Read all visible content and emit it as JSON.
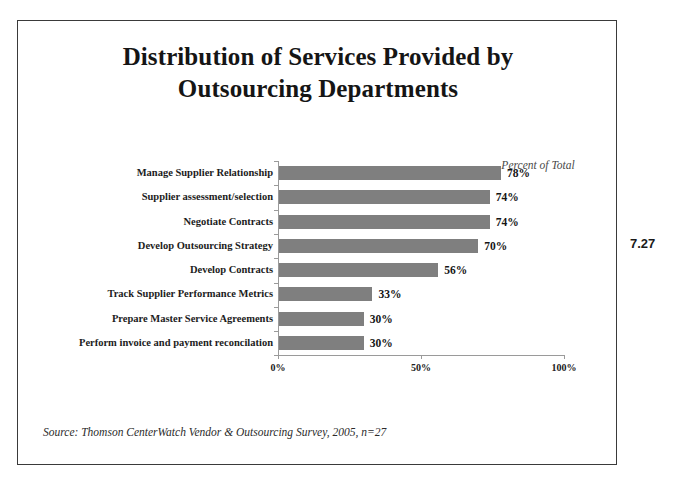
{
  "page_number": "7.27",
  "title": {
    "line1": "Distribution of Services Provided by",
    "line2": "Outsourcing Departments"
  },
  "axis_caption": "Percent of Total",
  "source_note": "Source: Thomson CenterWatch Vendor & Outsourcing Survey, 2005, n=27",
  "colors": {
    "bar": "#7f7f7f",
    "frame": "#3a3a3a",
    "axis": "#9a9a9a",
    "text": "#151515",
    "background": "#ffffff"
  },
  "chart_data": {
    "type": "bar",
    "orientation": "horizontal",
    "title": "Distribution of Services Provided by Outsourcing Departments",
    "subtitle": "",
    "xlabel": "Percent of Total",
    "ylabel": "",
    "xlim": [
      0,
      100
    ],
    "xticks": [
      0,
      50,
      100
    ],
    "xtick_labels": [
      "0%",
      "50%",
      "100%"
    ],
    "grid": false,
    "legend": false,
    "categories": [
      "Manage Supplier Relationship",
      "Supplier assessment/selection",
      "Negotiate Contracts",
      "Develop Outsourcing Strategy",
      "Develop Contracts",
      "Track Supplier Performance Metrics",
      "Prepare Master Service Agreements",
      "Perform invoice and payment reconcilation"
    ],
    "values": [
      78,
      74,
      74,
      70,
      56,
      33,
      30,
      30
    ],
    "data_labels": [
      "78%",
      "74%",
      "74%",
      "70%",
      "56%",
      "33%",
      "30%",
      "30%"
    ],
    "annotations": [
      "Percent of Total"
    ]
  }
}
